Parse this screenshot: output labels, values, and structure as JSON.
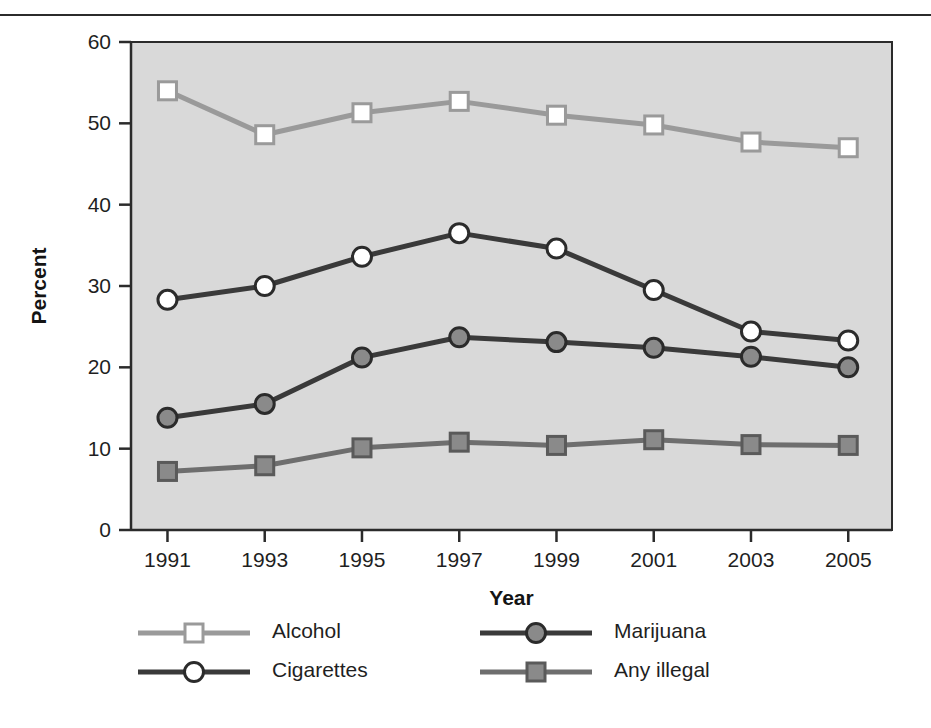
{
  "figure": {
    "has_top_rule": true,
    "background": "#ffffff",
    "plot_background": "#d9d9d9"
  },
  "chart_data": {
    "type": "line",
    "title": "",
    "subtitle": "",
    "xlabel": "Year",
    "ylabel": "Percent",
    "x": [
      1991,
      1993,
      1995,
      1997,
      1999,
      2001,
      2003,
      2005
    ],
    "categories": [
      "1991",
      "1993",
      "1995",
      "1997",
      "1999",
      "2001",
      "2003",
      "2005"
    ],
    "xtick_labels": [
      "1991",
      "1993",
      "1995",
      "1997",
      "1999",
      "2001",
      "2003",
      "2005"
    ],
    "ytick_labels": [
      "0",
      "10",
      "20",
      "30",
      "40",
      "50",
      "60"
    ],
    "yticks": [
      0,
      10,
      20,
      30,
      40,
      50,
      60
    ],
    "ylim": [
      0,
      60
    ],
    "xlim": [
      1990.25,
      2005.9
    ],
    "grid": false,
    "legend_position": "bottom",
    "series": [
      {
        "name": "Alcohol",
        "values": [
          54.0,
          48.6,
          51.3,
          52.7,
          51.0,
          49.8,
          47.7,
          47.0
        ],
        "color": "#9a9a9a",
        "marker": "square",
        "marker_fill": "#ffffff",
        "marker_edge": "#9a9a9a"
      },
      {
        "name": "Cigarettes",
        "values": [
          28.3,
          30.0,
          33.6,
          36.5,
          34.6,
          29.5,
          24.4,
          23.3
        ],
        "color": "#3a3a3a",
        "marker": "circle",
        "marker_fill": "#ffffff",
        "marker_edge": "#2b2b2b"
      },
      {
        "name": "Marijuana",
        "values": [
          13.8,
          15.5,
          21.2,
          23.7,
          23.1,
          22.4,
          21.3,
          20.0
        ],
        "color": "#3a3a3a",
        "marker": "circle",
        "marker_fill": "#8a8a8a",
        "marker_edge": "#2b2b2b"
      },
      {
        "name": "Any illegal",
        "values": [
          7.2,
          7.9,
          10.1,
          10.8,
          10.4,
          11.1,
          10.5,
          10.4
        ],
        "color": "#6e6e6e",
        "marker": "square",
        "marker_fill": "#8a8a8a",
        "marker_edge": "#5a5a5a"
      }
    ]
  },
  "legend": {
    "entries": [
      {
        "label": "Alcohol",
        "series_index": 0
      },
      {
        "label": "Marijuana",
        "series_index": 2
      },
      {
        "label": "Cigarettes",
        "series_index": 1
      },
      {
        "label": "Any illegal",
        "series_index": 3
      }
    ]
  }
}
